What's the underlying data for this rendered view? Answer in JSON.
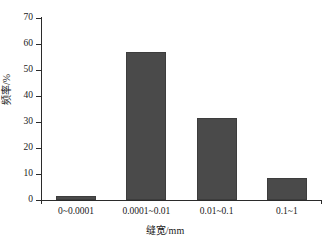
{
  "chart_data": {
    "type": "bar",
    "title": "",
    "categories": [
      "0~0.0001",
      "0.0001~0.01",
      "0.01~0.1",
      "0.1~1"
    ],
    "values": [
      1.7,
      57,
      31.5,
      8.5
    ],
    "xlabel": "缝宽/mm",
    "ylabel": "频率/%",
    "ylim": [
      0,
      70
    ],
    "yticks": [
      0,
      10,
      20,
      30,
      40,
      50,
      60,
      70
    ],
    "ytick_labels": [
      "0",
      "10",
      "20",
      "30",
      "40",
      "50",
      "60",
      "70"
    ],
    "grid": false,
    "legend": false,
    "bar_color": "#4a4a4a",
    "axis_color": "#2b2b2b",
    "background": "#ffffff"
  }
}
